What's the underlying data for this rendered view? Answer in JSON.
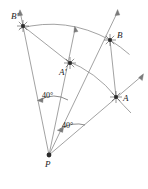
{
  "figure": {
    "background_color": "#ffffff",
    "line_color": "#8a8a8a",
    "point_color": "#2b2b2b",
    "label_color": "#1d1d1d",
    "points": [
      {
        "id": "b-prime",
        "label": "B'",
        "x": 23,
        "y": 26,
        "label_x": 11,
        "label_y": 12
      },
      {
        "id": "a-prime",
        "label": "A'",
        "x": 70,
        "y": 63,
        "label_x": 59,
        "label_y": 68
      },
      {
        "id": "b",
        "label": "B",
        "x": 110,
        "y": 40,
        "label_x": 117,
        "label_y": 31
      },
      {
        "id": "a",
        "label": "A",
        "x": 116,
        "y": 97,
        "label_x": 123,
        "label_y": 94
      },
      {
        "id": "p",
        "label": "P",
        "x": 49,
        "y": 155,
        "label_x": 45,
        "label_y": 160
      }
    ],
    "angles": [
      {
        "id": "angle-bpb-prime",
        "label": "40°",
        "value": 40,
        "label_x": 42,
        "label_y": 92
      },
      {
        "id": "angle-apa-prime",
        "label": "40°",
        "value": 40,
        "label_x": 62,
        "label_y": 122
      }
    ],
    "arcs": [
      {
        "id": "arc-b-to-b-prime",
        "from": "B",
        "to": "B'",
        "center": "P"
      },
      {
        "id": "arc-a-to-a-prime",
        "from": "A",
        "to": "A'",
        "center": "P"
      }
    ],
    "segments": [
      {
        "id": "segment-b-prime-a-prime",
        "from": "B'",
        "to": "A'"
      },
      {
        "id": "segment-b-a",
        "from": "B",
        "to": "A"
      }
    ],
    "rays": [
      {
        "id": "ray-p-b-prime",
        "from": "P",
        "through": "B'"
      },
      {
        "id": "ray-p-a-prime",
        "from": "P",
        "through": "A'"
      },
      {
        "id": "ray-p-b",
        "from": "P",
        "through": "B"
      },
      {
        "id": "ray-p-a",
        "from": "P",
        "through": "A"
      }
    ]
  }
}
